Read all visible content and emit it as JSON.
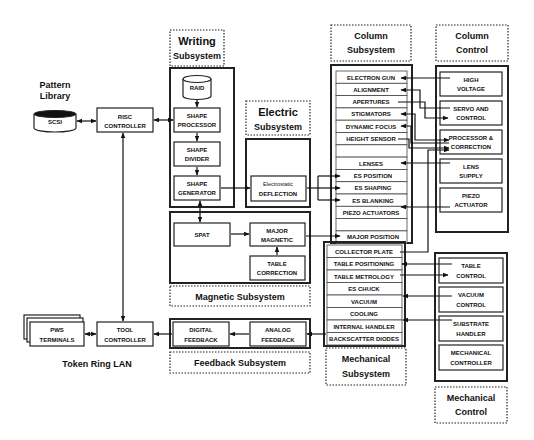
{
  "diagram": {
    "left": {
      "pattern_library": [
        "Pattern",
        "Library"
      ],
      "scsi": "SCSI",
      "risc_controller": [
        "RISC",
        "CONTROLLER"
      ],
      "tool_controller": [
        "TOOL",
        "CONTROLLER"
      ],
      "pws_terminals": [
        "PWS",
        "TERMINALS"
      ],
      "token_ring": "Token Ring LAN"
    },
    "writing": {
      "label": [
        "Writing",
        "Subsystem"
      ],
      "raid": "RAID",
      "shape_processor": [
        "SHAPE",
        "PROCESSOR"
      ],
      "shape_divider": [
        "SHAPE",
        "DIVIDER"
      ],
      "shape_generator": [
        "SHAPE",
        "GENERATOR"
      ]
    },
    "electric": {
      "label": [
        "Electric",
        "Subsystem"
      ],
      "deflection": [
        "Electrostatic",
        "DEFLECTION"
      ]
    },
    "magnetic": {
      "label": "Magnetic Subsystem",
      "spat": "SPAT",
      "major_magnetic": [
        "MAJOR",
        "MAGNETIC"
      ],
      "table_correction": [
        "TABLE",
        "CORRECTION"
      ]
    },
    "feedback": {
      "label": "Feedback Subsystem",
      "digital": [
        "DIGITAL",
        "FEEDBACK"
      ],
      "analog": [
        "ANALOG",
        "FEEDBACK"
      ]
    },
    "column": {
      "label": [
        "Column",
        "Subsystem"
      ],
      "items": [
        "ELECTRON GUN",
        "ALIGNMENT",
        "APERTURES",
        "STIGMATORS",
        "DYNAMIC FOCUS",
        "HEIGHT SENSOR",
        "",
        "LENSES",
        "ES POSITION",
        "ES SHAPING",
        "ES BLANKING",
        "PIEZO ACTUATORS",
        "",
        "MAJOR POSITION"
      ]
    },
    "mechanical": {
      "label": [
        "Mechanical",
        "Subsystem"
      ],
      "items": [
        "COLLECTOR PLATE",
        "TABLE POSITIONING",
        "TABLE METROLOGY",
        "ES CHUCK",
        "VACUUM",
        "COOLING",
        "INTERNAL HANDLER",
        "BACKSCATTER DIODES"
      ]
    },
    "column_control": {
      "label": [
        "Column",
        "Control"
      ],
      "items": [
        [
          "HIGH",
          "VOLTAGE"
        ],
        [
          "SERVO AND",
          "CONTROL"
        ],
        [
          "PROCESSOR &",
          "CORRECTION"
        ],
        [
          "LENS",
          "SUPPLY"
        ],
        [
          "PIEZO",
          "ACTUATOR"
        ]
      ]
    },
    "mechanical_control": {
      "label": [
        "Mechanical",
        "Control"
      ],
      "items": [
        [
          "TABLE",
          "CONTROL"
        ],
        [
          "VACUUM",
          "CONTROL"
        ],
        [
          "SUBSTRATE",
          "HANDLER"
        ],
        [
          "MECHANICAL",
          "CONTROLLER"
        ]
      ]
    }
  }
}
